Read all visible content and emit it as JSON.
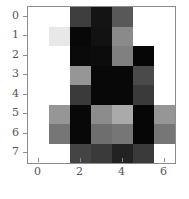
{
  "figure": {
    "type": "heatmap-image-plot",
    "background_color": "#ffffff",
    "axis_color": "#8c8c8c",
    "tick_label_color": "#555555"
  },
  "xaxis": {
    "label": "",
    "ticks": [
      {
        "value": "0",
        "pos": 0
      },
      {
        "value": "2",
        "pos": 2
      },
      {
        "value": "4",
        "pos": 4
      },
      {
        "value": "6",
        "pos": 6
      }
    ],
    "range": [
      -0.5,
      6.5
    ]
  },
  "yaxis": {
    "label": "",
    "ticks": [
      {
        "value": "0",
        "pos": 0
      },
      {
        "value": "1",
        "pos": 1
      },
      {
        "value": "2",
        "pos": 2
      },
      {
        "value": "3",
        "pos": 3
      },
      {
        "value": "4",
        "pos": 4
      },
      {
        "value": "5",
        "pos": 5
      },
      {
        "value": "6",
        "pos": 6
      },
      {
        "value": "7",
        "pos": 7
      }
    ],
    "range": [
      -0.5,
      7.5
    ],
    "inverted": true
  },
  "chart_data": {
    "type": "heatmap",
    "title": "",
    "xlabel": "",
    "ylabel": "",
    "colormap": "gray",
    "vmin": 0,
    "vmax": 255,
    "grid": false,
    "legend": "none",
    "xlim": [
      -0.5,
      6.5
    ],
    "ylim": [
      7.5,
      -0.5
    ],
    "categories_x": [
      "0",
      "1",
      "2",
      "3",
      "4",
      "5",
      "6"
    ],
    "categories_y": [
      "0",
      "1",
      "2",
      "3",
      "4",
      "5",
      "6",
      "7"
    ],
    "values": [
      [
        255,
        255,
        62,
        20,
        88,
        255,
        255
      ],
      [
        255,
        232,
        8,
        18,
        138,
        255,
        255
      ],
      [
        255,
        255,
        10,
        12,
        128,
        6,
        255
      ],
      [
        255,
        255,
        150,
        8,
        8,
        74,
        255
      ],
      [
        255,
        255,
        58,
        8,
        8,
        58,
        255
      ],
      [
        255,
        150,
        8,
        140,
        170,
        6,
        150
      ],
      [
        255,
        118,
        8,
        110,
        118,
        6,
        118
      ],
      [
        255,
        255,
        68,
        58,
        34,
        58,
        255
      ]
    ],
    "colors": [
      [
        "#ffffff",
        "#ffffff",
        "#3e3e3e",
        "#141414",
        "#585858",
        "#ffffff",
        "#ffffff"
      ],
      [
        "#ffffff",
        "#e8e8e8",
        "#080808",
        "#121212",
        "#8a8a8a",
        "#ffffff",
        "#ffffff"
      ],
      [
        "#ffffff",
        "#ffffff",
        "#0a0a0a",
        "#0c0c0c",
        "#808080",
        "#060606",
        "#ffffff"
      ],
      [
        "#ffffff",
        "#ffffff",
        "#969696",
        "#080808",
        "#080808",
        "#4a4a4a",
        "#ffffff"
      ],
      [
        "#ffffff",
        "#ffffff",
        "#3a3a3a",
        "#080808",
        "#080808",
        "#3a3a3a",
        "#ffffff"
      ],
      [
        "#ffffff",
        "#969696",
        "#080808",
        "#8c8c8c",
        "#aaaaaa",
        "#060606",
        "#969696"
      ],
      [
        "#ffffff",
        "#767676",
        "#080808",
        "#6e6e6e",
        "#767676",
        "#060606",
        "#767676"
      ],
      [
        "#ffffff",
        "#ffffff",
        "#444444",
        "#3a3a3a",
        "#222222",
        "#3a3a3a",
        "#ffffff"
      ]
    ]
  }
}
